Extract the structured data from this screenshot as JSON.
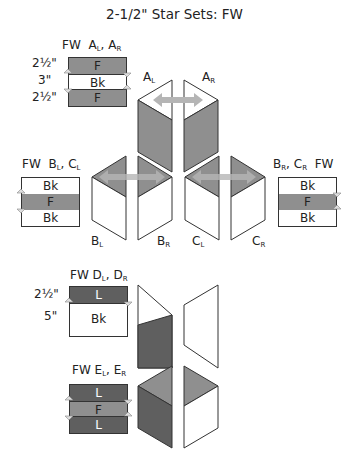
{
  "title": "2-1/2\" Star Sets: FW",
  "colors": {
    "fabric_f": "#8f8f8f",
    "fabric_l": "#5f5f5f",
    "background_bk": "#ffffff",
    "arrow": "#b5b5b5",
    "outline": "#333333"
  },
  "sets": {
    "a": {
      "heading_prefix": "FW",
      "heading_units": [
        "A",
        "L",
        "A",
        "R"
      ],
      "dims": [
        "2½\"",
        "3\"",
        "2½\""
      ],
      "strips": [
        "F",
        "Bk",
        "F"
      ],
      "piece_labels": [
        {
          "main": "A",
          "sub": "L"
        },
        {
          "main": "A",
          "sub": "R"
        }
      ]
    },
    "b": {
      "heading_prefix": "FW",
      "heading_units": [
        "B",
        "L",
        "C",
        "L"
      ],
      "strips": [
        "Bk",
        "F",
        "Bk"
      ],
      "piece_labels": [
        {
          "main": "B",
          "sub": "L"
        },
        {
          "main": "B",
          "sub": "R"
        }
      ]
    },
    "c": {
      "heading_suffix": "FW",
      "heading_units": [
        "B",
        "R",
        "C",
        "R"
      ],
      "strips": [
        "Bk",
        "F",
        "Bk"
      ],
      "piece_labels": [
        {
          "main": "C",
          "sub": "L"
        },
        {
          "main": "C",
          "sub": "R"
        }
      ]
    },
    "d": {
      "heading_prefix": "FW",
      "heading_units": [
        "D",
        "L",
        "D",
        "R"
      ],
      "dims": [
        "2½\"",
        "5\""
      ],
      "strips": [
        "L",
        "Bk"
      ]
    },
    "e": {
      "heading_prefix": "FW",
      "heading_units": [
        "E",
        "L",
        "E",
        "R"
      ],
      "strips": [
        "L",
        "F",
        "L"
      ]
    }
  }
}
